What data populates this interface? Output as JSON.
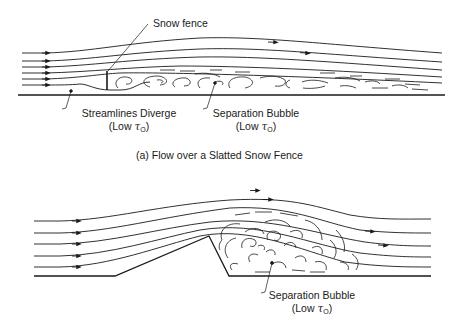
{
  "figure_a": {
    "caption": "(a)  Flow over a Slatted Snow Fence",
    "labels": {
      "snow_fence": "Snow fence",
      "streamlines_diverge": "Streamlines Diverge",
      "streamlines_diverge_sub_prefix": "(Low ",
      "separation_bubble": "Separation Bubble",
      "separation_bubble_sub_prefix": "(Low "
    }
  },
  "figure_b": {
    "labels": {
      "separation_bubble": "Separation Bubble",
      "separation_bubble_sub_prefix": "(Low "
    }
  },
  "symbols": {
    "tau": "τ",
    "tau_subscript": "O",
    "close_paren": ")"
  },
  "colors": {
    "line": "#1a1a1a",
    "background": "#ffffff"
  }
}
